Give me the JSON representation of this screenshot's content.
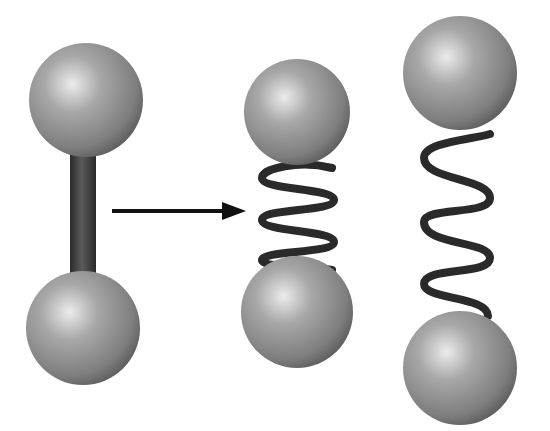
{
  "diagram": {
    "colors": {
      "background": "#ffffff",
      "sphere_highlight": "#e6e6e6",
      "sphere_mid": "#9a9a9a",
      "sphere_edge": "#5e5e5e",
      "rod": "#3c3c3c",
      "spring": "#2a2a2a",
      "arrow": "#111111"
    },
    "models": [
      {
        "id": "rigid",
        "bond": "rod"
      },
      {
        "id": "spring-compressed",
        "bond": "spring",
        "coils": 3
      },
      {
        "id": "spring-stretched",
        "bond": "spring",
        "coils": 3
      }
    ],
    "arrow": {
      "from": "rigid",
      "to": "spring-compressed"
    }
  }
}
